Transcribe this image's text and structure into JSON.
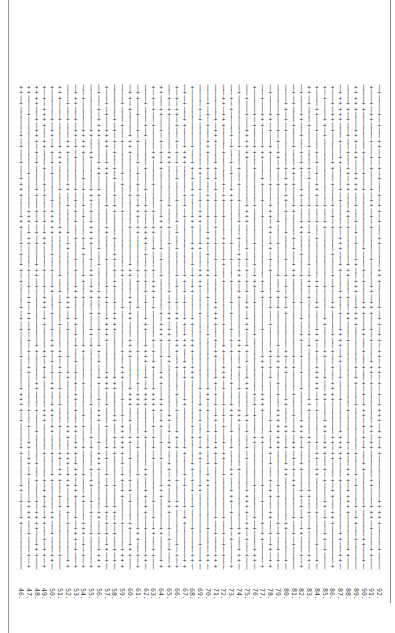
{
  "document": {
    "orientation": "rotated-90",
    "glyphs": {
      "plus": "+",
      "bar": "|"
    },
    "row_labels": [
      "46.",
      "47.",
      "48.",
      "49.",
      "50.",
      "51.",
      "52.",
      "53.",
      "54.",
      "55.",
      "56.",
      "57.",
      "58.",
      "59.",
      "60.",
      "61.",
      "62.",
      "63.",
      "64.",
      "65.",
      "66.",
      "67.",
      "68.",
      "69.",
      "70.",
      "71.",
      "72.",
      "73.",
      "74.",
      "75.",
      "76.",
      "77.",
      "78.",
      "79.",
      "80.",
      "81.",
      "82.",
      "83.",
      "84.",
      "85.",
      "86.",
      "87.",
      "88.",
      "89.",
      "90.",
      "91.",
      "92."
    ],
    "rows_per_line": 90,
    "pattern_seed": 46,
    "plus_ratio": 0.38
  }
}
